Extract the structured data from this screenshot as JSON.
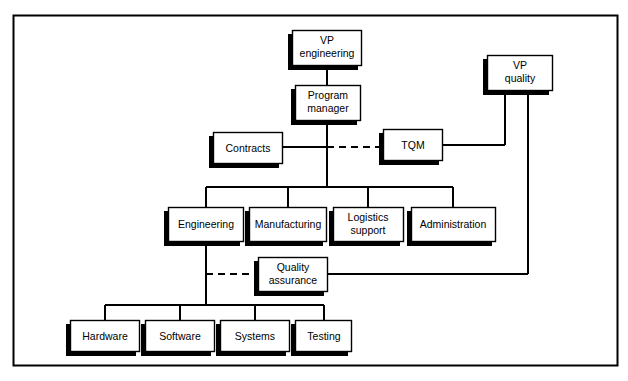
{
  "diagram": {
    "frame": {
      "x": 13,
      "y": 15,
      "width": 605,
      "height": 351,
      "border_color": "#000000"
    },
    "style": {
      "box_fill": "#ffffff",
      "box_border": "#000000",
      "shadow_color": "#000000",
      "line_color": "#000000",
      "text_color": "#000000"
    },
    "nodes": [
      {
        "id": "vp-engineering",
        "label": "VP engineering",
        "lines": [
          "VP",
          "engineering"
        ],
        "x": 292,
        "y": 30,
        "w": 70,
        "h": 36
      },
      {
        "id": "program-manager",
        "label": "Program manager",
        "lines": [
          "Program",
          "manager"
        ],
        "x": 295,
        "y": 85,
        "w": 66,
        "h": 36
      },
      {
        "id": "vp-quality",
        "label": "VP quality",
        "lines": [
          "VP",
          "quality"
        ],
        "x": 487,
        "y": 55,
        "w": 66,
        "h": 36
      },
      {
        "id": "contracts",
        "label": "Contracts",
        "lines": [
          "Contracts"
        ],
        "x": 213,
        "y": 132,
        "w": 70,
        "h": 32
      },
      {
        "id": "tqm",
        "label": "TQM",
        "lines": [
          "TQM"
        ],
        "x": 383,
        "y": 129,
        "w": 60,
        "h": 32
      },
      {
        "id": "engineering",
        "label": "Engineering",
        "lines": [
          "Engineering"
        ],
        "x": 168,
        "y": 207,
        "w": 76,
        "h": 35
      },
      {
        "id": "manufacturing",
        "label": "Manufacturing",
        "lines": [
          "Manufacturing"
        ],
        "x": 249,
        "y": 207,
        "w": 78,
        "h": 35
      },
      {
        "id": "logistics",
        "label": "Logistics support",
        "lines": [
          "Logistics",
          "support"
        ],
        "x": 333,
        "y": 207,
        "w": 71,
        "h": 35
      },
      {
        "id": "administration",
        "label": "Administration",
        "lines": [
          "Administration"
        ],
        "x": 411,
        "y": 207,
        "w": 85,
        "h": 35
      },
      {
        "id": "quality-assurance",
        "label": "Quality assurance",
        "lines": [
          "Quality",
          "assurance"
        ],
        "x": 258,
        "y": 257,
        "w": 70,
        "h": 35
      },
      {
        "id": "hardware",
        "label": "Hardware",
        "lines": [
          "Hardware"
        ],
        "x": 70,
        "y": 320,
        "w": 70,
        "h": 32
      },
      {
        "id": "software",
        "label": "Software",
        "lines": [
          "Software"
        ],
        "x": 145,
        "y": 320,
        "w": 70,
        "h": 32
      },
      {
        "id": "systems",
        "label": "Systems",
        "lines": [
          "Systems"
        ],
        "x": 220,
        "y": 320,
        "w": 70,
        "h": 32
      },
      {
        "id": "testing",
        "label": "Testing",
        "lines": [
          "Testing"
        ],
        "x": 295,
        "y": 320,
        "w": 57,
        "h": 32
      }
    ],
    "connectors": [
      {
        "id": "vpeng-to-pm",
        "from": "vp-engineering",
        "to": "program-manager",
        "style": "solid"
      },
      {
        "id": "pm-to-bus",
        "from": "program-manager",
        "to": "department-bus",
        "style": "solid"
      },
      {
        "id": "contracts-to-stem",
        "from": "contracts",
        "to": "program-stem",
        "style": "solid"
      },
      {
        "id": "stem-to-tqm",
        "from": "program-stem",
        "to": "tqm",
        "style": "dashed"
      },
      {
        "id": "tqm-to-vpquality",
        "from": "tqm",
        "to": "vp-quality",
        "style": "solid"
      },
      {
        "id": "vpquality-to-qa",
        "from": "vp-quality",
        "to": "quality-assurance",
        "style": "solid"
      },
      {
        "id": "bus-to-engineering",
        "from": "department-bus",
        "to": "engineering",
        "style": "solid"
      },
      {
        "id": "bus-to-manufacturing",
        "from": "department-bus",
        "to": "manufacturing",
        "style": "solid"
      },
      {
        "id": "bus-to-logistics",
        "from": "department-bus",
        "to": "logistics",
        "style": "solid"
      },
      {
        "id": "bus-to-administration",
        "from": "department-bus",
        "to": "administration",
        "style": "solid"
      },
      {
        "id": "engstem-to-qa",
        "from": "engineering-stem",
        "to": "quality-assurance",
        "style": "dashed"
      },
      {
        "id": "eng-to-hardware",
        "from": "engineering",
        "to": "hardware",
        "style": "solid"
      },
      {
        "id": "eng-to-software",
        "from": "engineering",
        "to": "software",
        "style": "solid"
      },
      {
        "id": "eng-to-systems",
        "from": "engineering",
        "to": "systems",
        "style": "solid"
      },
      {
        "id": "eng-to-testing",
        "from": "engineering",
        "to": "testing",
        "style": "solid"
      }
    ]
  }
}
